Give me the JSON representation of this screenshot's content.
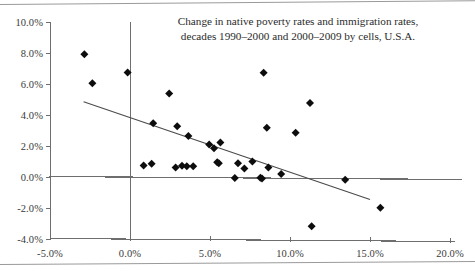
{
  "chart_data": {
    "type": "scatter",
    "title": "Change in native poverty rates and immigration rates, decades 1990–2000 and 2000–2009 by cells, U.S.A.",
    "title_line1": "Change in native poverty rates and immigration rates,",
    "title_line2": "decades 1990–2000 and 2000–2009 by cells, U.S.A.",
    "xlabel": "",
    "ylabel": "",
    "xlim": [
      -5.0,
      20.0
    ],
    "ylim": [
      -4.0,
      10.0
    ],
    "xticks": [
      -5.0,
      0.0,
      5.0,
      10.0,
      15.0,
      20.0
    ],
    "yticks": [
      -4.0,
      -2.0,
      0.0,
      2.0,
      4.0,
      6.0,
      8.0,
      10.0
    ],
    "xtick_labels": [
      "-5.0%",
      "0.0%",
      "5.0%",
      "10.0%",
      "15.0%",
      "20.0%"
    ],
    "ytick_labels": [
      "-4.0%",
      "-2.0%",
      "0.0%",
      "2.0%",
      "4.0%",
      "6.0%",
      "8.0%",
      "10.0%"
    ],
    "grid": false,
    "legend": null,
    "marker": "diamond",
    "marker_color": "#0d0d0d",
    "axis_color": "#6e6e6e",
    "zero_line": 0.0,
    "points": [
      {
        "x": -2.85,
        "y": 7.92
      },
      {
        "x": -2.35,
        "y": 6.05
      },
      {
        "x": -0.15,
        "y": 6.75
      },
      {
        "x": 1.45,
        "y": 3.47
      },
      {
        "x": 2.45,
        "y": 5.38
      },
      {
        "x": 2.95,
        "y": 3.27
      },
      {
        "x": 3.65,
        "y": 2.65
      },
      {
        "x": 4.95,
        "y": 2.1
      },
      {
        "x": 5.25,
        "y": 1.85
      },
      {
        "x": 5.65,
        "y": 2.22
      },
      {
        "x": 0.85,
        "y": 0.75
      },
      {
        "x": 1.35,
        "y": 0.85
      },
      {
        "x": 2.85,
        "y": 0.62
      },
      {
        "x": 3.25,
        "y": 0.72
      },
      {
        "x": 3.55,
        "y": 0.7
      },
      {
        "x": 3.95,
        "y": 0.7
      },
      {
        "x": 5.45,
        "y": 0.95
      },
      {
        "x": 5.55,
        "y": 0.88
      },
      {
        "x": 6.55,
        "y": -0.07
      },
      {
        "x": 6.75,
        "y": 0.88
      },
      {
        "x": 7.15,
        "y": 0.55
      },
      {
        "x": 7.65,
        "y": 1.0
      },
      {
        "x": 8.15,
        "y": -0.05
      },
      {
        "x": 8.25,
        "y": -0.1
      },
      {
        "x": 8.35,
        "y": 6.72
      },
      {
        "x": 8.55,
        "y": 3.18
      },
      {
        "x": 8.65,
        "y": 0.62
      },
      {
        "x": 9.45,
        "y": 0.2
      },
      {
        "x": 10.35,
        "y": 2.85
      },
      {
        "x": 11.25,
        "y": 4.78
      },
      {
        "x": 11.35,
        "y": -3.18
      },
      {
        "x": 13.45,
        "y": -0.18
      },
      {
        "x": 15.65,
        "y": -1.98
      }
    ],
    "trendline": {
      "type": "linear",
      "x_start": -2.9,
      "y_start": 4.85,
      "x_end": 15.0,
      "y_end": -1.45
    }
  }
}
